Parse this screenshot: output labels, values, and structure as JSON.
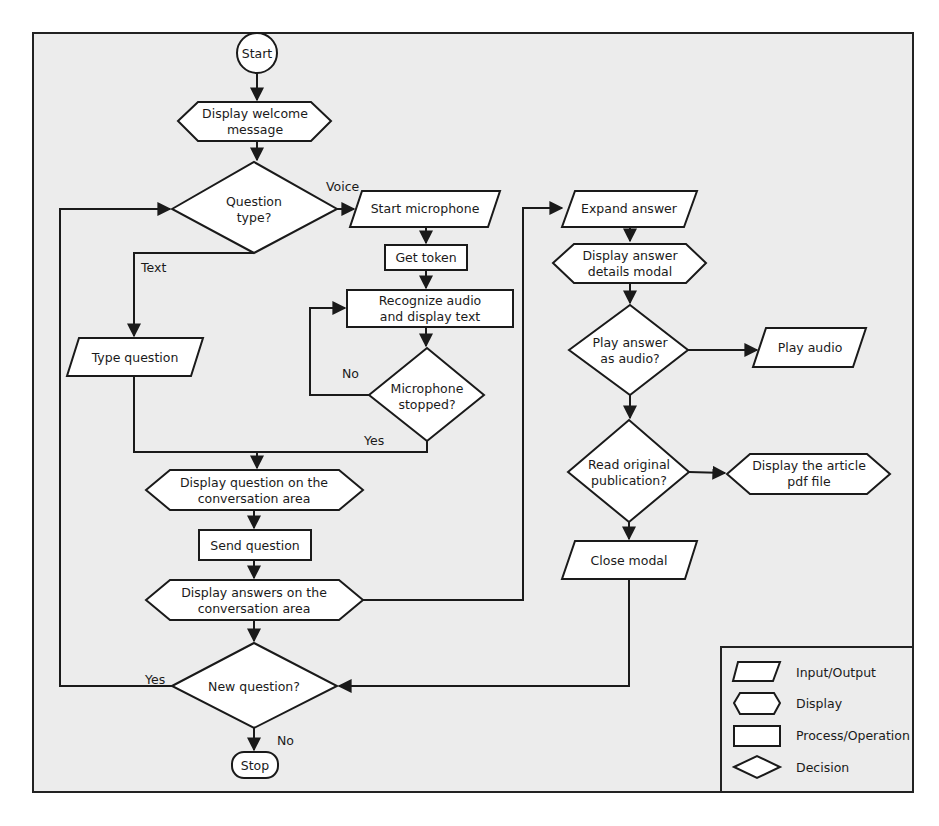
{
  "diagram": {
    "type": "flowchart",
    "nodes": {
      "start": {
        "shape": "terminal",
        "lines": [
          "Start"
        ]
      },
      "welcome": {
        "shape": "display",
        "lines": [
          "Display welcome",
          "message"
        ]
      },
      "question_type": {
        "shape": "decision",
        "lines": [
          "Question",
          "type?"
        ]
      },
      "start_mic": {
        "shape": "input-output",
        "lines": [
          "Start microphone"
        ]
      },
      "get_token": {
        "shape": "process",
        "lines": [
          "Get token"
        ]
      },
      "recognize": {
        "shape": "process",
        "lines": [
          "Recognize audio",
          "and display text"
        ]
      },
      "mic_stopped": {
        "shape": "decision",
        "lines": [
          "Microphone",
          "stopped?"
        ]
      },
      "type_question": {
        "shape": "input-output",
        "lines": [
          "Type question"
        ]
      },
      "display_question": {
        "shape": "display",
        "lines": [
          "Display question on the",
          "conversation area"
        ]
      },
      "send_question": {
        "shape": "process",
        "lines": [
          "Send question"
        ]
      },
      "display_answers": {
        "shape": "display",
        "lines": [
          "Display answers on the",
          "conversation area"
        ]
      },
      "new_question": {
        "shape": "decision",
        "lines": [
          "New question?"
        ]
      },
      "stop": {
        "shape": "terminal",
        "lines": [
          "Stop"
        ]
      },
      "expand_answer": {
        "shape": "input-output",
        "lines": [
          "Expand answer"
        ]
      },
      "answer_details": {
        "shape": "display",
        "lines": [
          "Display answer",
          "details modal"
        ]
      },
      "play_answer": {
        "shape": "decision",
        "lines": [
          "Play answer",
          "as audio?"
        ]
      },
      "play_audio": {
        "shape": "input-output",
        "lines": [
          "Play audio"
        ]
      },
      "read_original": {
        "shape": "decision",
        "lines": [
          "Read original",
          "publication?"
        ]
      },
      "display_article": {
        "shape": "display",
        "lines": [
          "Display the article",
          "pdf file"
        ]
      },
      "close_modal": {
        "shape": "input-output",
        "lines": [
          "Close modal"
        ]
      }
    },
    "edges": [
      {
        "from": "start",
        "to": "welcome",
        "label": ""
      },
      {
        "from": "welcome",
        "to": "question_type",
        "label": ""
      },
      {
        "from": "question_type",
        "to": "start_mic",
        "label": "Voice"
      },
      {
        "from": "question_type",
        "to": "type_question",
        "label": "Text"
      },
      {
        "from": "start_mic",
        "to": "get_token",
        "label": ""
      },
      {
        "from": "get_token",
        "to": "recognize",
        "label": ""
      },
      {
        "from": "recognize",
        "to": "mic_stopped",
        "label": ""
      },
      {
        "from": "mic_stopped",
        "to": "recognize",
        "label": "No"
      },
      {
        "from": "mic_stopped",
        "to": "display_question",
        "label": "Yes"
      },
      {
        "from": "type_question",
        "to": "display_question",
        "label": ""
      },
      {
        "from": "display_question",
        "to": "send_question",
        "label": ""
      },
      {
        "from": "send_question",
        "to": "display_answers",
        "label": ""
      },
      {
        "from": "display_answers",
        "to": "new_question",
        "label": ""
      },
      {
        "from": "display_answers",
        "to": "expand_answer",
        "label": ""
      },
      {
        "from": "new_question",
        "to": "question_type",
        "label": "Yes"
      },
      {
        "from": "new_question",
        "to": "stop",
        "label": "No"
      },
      {
        "from": "expand_answer",
        "to": "answer_details",
        "label": ""
      },
      {
        "from": "answer_details",
        "to": "play_answer",
        "label": ""
      },
      {
        "from": "play_answer",
        "to": "play_audio",
        "label": ""
      },
      {
        "from": "play_answer",
        "to": "read_original",
        "label": ""
      },
      {
        "from": "read_original",
        "to": "display_article",
        "label": ""
      },
      {
        "from": "read_original",
        "to": "close_modal",
        "label": ""
      },
      {
        "from": "close_modal",
        "to": "new_question",
        "label": ""
      }
    ],
    "edge_labels": {
      "voice": "Voice",
      "text": "Text",
      "no_mic": "No",
      "yes_mic": "Yes",
      "yes_new": "Yes",
      "no_new": "No"
    },
    "legend": {
      "items": [
        {
          "shape": "input-output",
          "label": "Input/Output"
        },
        {
          "shape": "display",
          "label": "Display"
        },
        {
          "shape": "process",
          "label": "Process/Operation"
        },
        {
          "shape": "decision",
          "label": "Decision"
        }
      ]
    },
    "colors": {
      "background": "#ececec",
      "shape_fill": "#ffffff",
      "stroke": "#1a1a1a"
    }
  }
}
